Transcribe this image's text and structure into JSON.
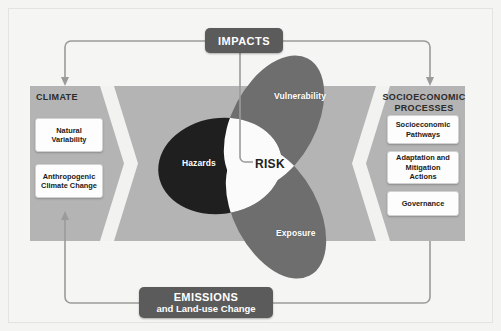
{
  "figure": {
    "colors": {
      "background": "#f4f4f2",
      "band": "#b4b4b4",
      "chevron": "#f2f2f0",
      "hazards": "#1f1f1f",
      "vulnerability": "#6e6e6e",
      "exposure": "#6e6e6e",
      "risk_core": "#fbfbfb",
      "dark_box": "#5b5b5b",
      "card": "#fdfdfd",
      "connector": "#9b9b9b"
    }
  },
  "top_box": {
    "label": "IMPACTS",
    "name": "impacts-box"
  },
  "bottom_box": {
    "line1": "EMISSIONS",
    "line2": "and Land-use Change",
    "name": "emissions-box"
  },
  "climate": {
    "title": "CLIMATE",
    "cards": [
      {
        "label": "Natural\nVariability"
      },
      {
        "label": "Anthropogenic\nClimate Change"
      }
    ]
  },
  "socioeconomic": {
    "title": "SOCIOECONOMIC\nPROCESSES",
    "cards": [
      {
        "label": "Socioeconomic\nPathways"
      },
      {
        "label": "Adaptation and\nMitigation\nActions"
      },
      {
        "label": "Governance"
      }
    ]
  },
  "venn": {
    "center_label": "RISK",
    "sets": [
      {
        "key": "hazards",
        "label": "Hazards",
        "color": "#1f1f1f"
      },
      {
        "key": "vulnerability",
        "label": "Vulnerability",
        "color": "#6e6e6e"
      },
      {
        "key": "exposure",
        "label": "Exposure",
        "color": "#6e6e6e"
      }
    ]
  },
  "connectors": [
    {
      "name": "impacts-to-climate",
      "from": "IMPACTS",
      "to": "CLIMATE",
      "arrow": true
    },
    {
      "name": "impacts-to-socioeconomic",
      "from": "IMPACTS",
      "to": "SOCIOECONOMIC PROCESSES",
      "arrow": true
    },
    {
      "name": "impacts-to-risk",
      "from": "IMPACTS",
      "to": "RISK",
      "arrow": false
    },
    {
      "name": "socioeconomic-to-emissions",
      "from": "SOCIOECONOMIC PROCESSES",
      "to": "EMISSIONS",
      "arrow": false
    },
    {
      "name": "emissions-to-climate",
      "from": "EMISSIONS",
      "to": "Anthropogenic Climate Change",
      "arrow": true
    }
  ]
}
